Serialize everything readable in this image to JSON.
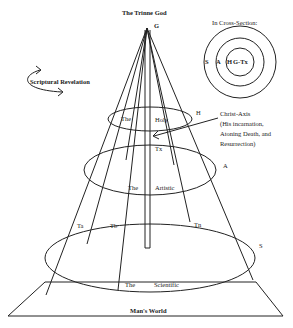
{
  "title": "The Trinne God",
  "apex_label": "G",
  "cross_section": {
    "title": "In Cross-Section:",
    "rings": [
      "S",
      "A",
      "H",
      "G-Tx"
    ]
  },
  "scriptural_revelation": "Scriptural Revelation",
  "levels": {
    "holy": {
      "the": "The",
      "name": "Holy",
      "marker": "H"
    },
    "artistic": {
      "the": "The",
      "name": "Artistic",
      "marker": "A"
    },
    "scientific": {
      "the": "The",
      "name": "Scientific",
      "marker": "S"
    }
  },
  "christ_axis": {
    "title": "Christ-Axis",
    "lines": [
      "(His incarnation,",
      "Atoning Death, and",
      "Resurrection)"
    ],
    "axis_label": "Tx"
  },
  "threads": [
    "Ta",
    "Tb",
    "Tn"
  ],
  "base_label": "Man's World",
  "colors": {
    "ink": "#222222",
    "paper": "#ffffff"
  }
}
